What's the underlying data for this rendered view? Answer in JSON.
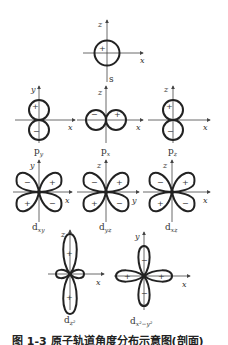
{
  "orbitals": {
    "s": {
      "name": "s",
      "sub": "",
      "axes": [
        "z",
        "x"
      ],
      "signs": [
        "+"
      ]
    },
    "py": {
      "name": "p",
      "sub": "y",
      "axes": [
        "y",
        "x"
      ],
      "signs": [
        "+",
        "−"
      ]
    },
    "px": {
      "name": "p",
      "sub": "x",
      "axes": [
        "z",
        "x"
      ],
      "signs": [
        "−",
        "+"
      ]
    },
    "pz": {
      "name": "p",
      "sub": "z",
      "axes": [
        "z",
        "x"
      ],
      "signs": [
        "+",
        "−"
      ]
    },
    "dxy": {
      "name": "d",
      "sub": "xy",
      "axes": [
        "y",
        "x"
      ],
      "signs": [
        "−",
        "+",
        "+",
        "−"
      ]
    },
    "dyz": {
      "name": "d",
      "sub": "yz",
      "axes": [
        "z",
        "y"
      ],
      "signs": [
        "−",
        "+",
        "+",
        "−"
      ]
    },
    "dxz": {
      "name": "d",
      "sub": "xz",
      "axes": [
        "z",
        "x"
      ],
      "signs": [
        "−",
        "+",
        "+",
        "−"
      ]
    },
    "dz2": {
      "name": "d",
      "sub": "z²",
      "axes": [
        "z",
        "x"
      ],
      "signs": [
        "+",
        "+"
      ]
    },
    "dx2y2": {
      "name": "d",
      "sub": "x²−y²",
      "axes": [
        "y",
        "x"
      ],
      "signs": [
        "−",
        "+",
        "+",
        "−"
      ]
    }
  },
  "caption": "图 1-3  原子轨道角度分布示意图(剖面)",
  "colors": {
    "line": "#222222",
    "axis": "#444444",
    "background": "#ffffff"
  }
}
